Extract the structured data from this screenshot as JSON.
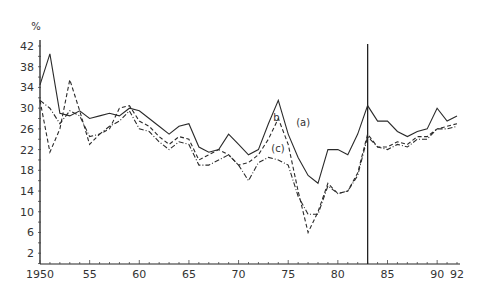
{
  "chart_data": {
    "type": "line",
    "title": "",
    "xlabel": "",
    "ylabel": "%",
    "xlim": [
      1950,
      1992
    ],
    "ylim": [
      0,
      42
    ],
    "grid": false,
    "x_tick_labels": [
      "1950",
      "55",
      "60",
      "65",
      "70",
      "75",
      "80",
      "85",
      "90",
      "92"
    ],
    "x_tick_values": [
      1950,
      1955,
      1960,
      1965,
      1970,
      1975,
      1980,
      1985,
      1990,
      1992
    ],
    "y_tick_labels": [
      "2",
      "6",
      "10",
      "14",
      "18",
      "22",
      "26",
      "30",
      "34",
      "38",
      "42"
    ],
    "y_tick_values": [
      2,
      6,
      10,
      14,
      18,
      22,
      26,
      30,
      34,
      38,
      42
    ],
    "annotations": [
      {
        "text": "(a)",
        "x": 1975.8,
        "y": 26.5
      },
      {
        "text": "b",
        "x": 1973.5,
        "y": 27.5
      },
      {
        "text": "(c)",
        "x": 1973.3,
        "y": 21.5
      },
      {
        "text": "vertical reference line",
        "x": 1983
      }
    ],
    "vertical_line_x": 1983,
    "x": [
      1950,
      1951,
      1952,
      1953,
      1954,
      1955,
      1956,
      1957,
      1958,
      1959,
      1960,
      1961,
      1962,
      1963,
      1964,
      1965,
      1966,
      1967,
      1968,
      1969,
      1970,
      1971,
      1972,
      1973,
      1974,
      1975,
      1976,
      1977,
      1978,
      1979,
      1980,
      1981,
      1982,
      1983,
      1984,
      1985,
      1986,
      1987,
      1988,
      1989,
      1990,
      1991,
      1992
    ],
    "series": [
      {
        "name": "(a)",
        "style": "solid",
        "values": [
          34.5,
          40.5,
          29,
          28.5,
          29.5,
          28,
          28.5,
          29,
          28.5,
          30,
          29.5,
          28,
          26.5,
          25,
          26.5,
          27,
          22.5,
          21.5,
          22,
          25,
          23,
          21,
          22,
          27,
          31.5,
          25,
          20.5,
          17,
          15.5,
          22,
          22,
          21,
          25,
          30.5,
          27.5,
          27.5,
          25.5,
          24.5,
          25.5,
          26,
          30,
          27.5,
          28.5
        ]
      },
      {
        "name": "(b)",
        "style": "dashed",
        "values": [
          31.5,
          21.5,
          26,
          35.5,
          29.5,
          23,
          25,
          26,
          30,
          30.5,
          27.5,
          26.5,
          24.5,
          23,
          24.5,
          24,
          20,
          21,
          22,
          21,
          19,
          19.5,
          21,
          24,
          28,
          23,
          14,
          6,
          10,
          15.5,
          13.5,
          14,
          17.5,
          25,
          22.5,
          22.5,
          23.5,
          23,
          24.5,
          24.5,
          26,
          26.5,
          27
        ]
      },
      {
        "name": "(c)",
        "style": "dash-dot",
        "values": [
          31.5,
          30,
          27,
          29.5,
          28.5,
          24.5,
          25,
          26.5,
          27.5,
          29.5,
          26,
          25.5,
          23.5,
          22,
          23.5,
          23,
          19,
          19,
          20,
          21,
          19,
          16,
          19.5,
          20.5,
          20,
          19,
          13,
          9.5,
          9.5,
          15,
          13.5,
          14,
          17,
          24.5,
          22.5,
          22,
          23,
          22.5,
          24,
          24,
          26,
          26,
          26.5
        ]
      }
    ],
    "legend_position": "inline labels"
  }
}
